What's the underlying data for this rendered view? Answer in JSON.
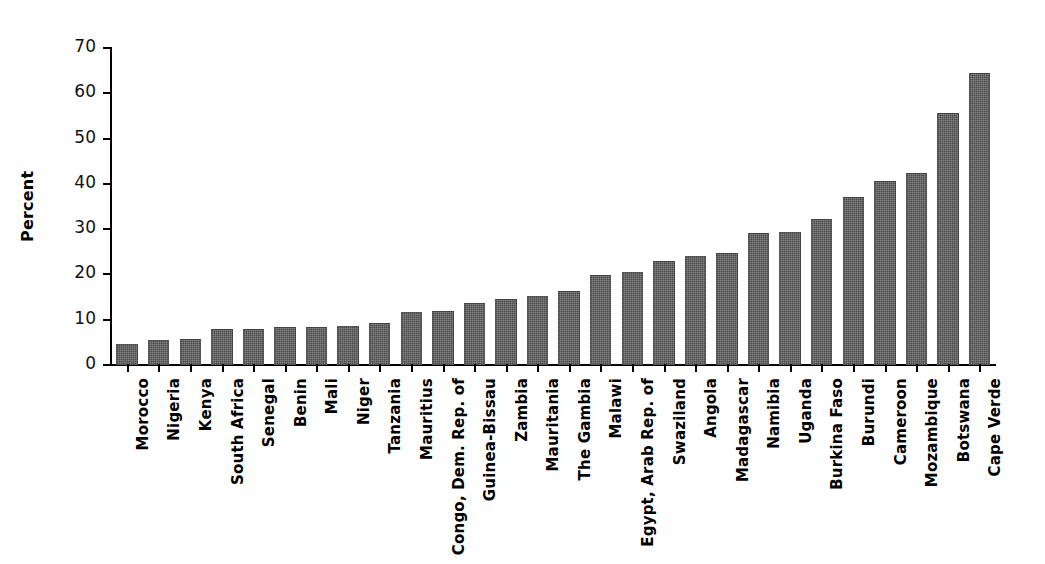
{
  "chart_data": {
    "type": "bar",
    "title": "",
    "xlabel": "",
    "ylabel": "Percent",
    "ylim": [
      0,
      70
    ],
    "yticks": [
      0,
      10,
      20,
      30,
      40,
      50,
      60,
      70
    ],
    "ytick_labels": [
      "0",
      "10",
      "20",
      "30",
      "40",
      "50",
      "60",
      "70"
    ],
    "grid": false,
    "legend": null,
    "bar_color": "#4b4b4b",
    "categories": [
      "Morocco",
      "Nigeria",
      "Kenya",
      "South Africa",
      "Senegal",
      "Benin",
      "Mali",
      "Niger",
      "Tanzania",
      "Mauritius",
      "Congo, Dem. Rep. of",
      "Guinea-Bissau",
      "Zambia",
      "Mauritania",
      "The Gambia",
      "Malawi",
      "Egypt, Arab Rep. of",
      "Swaziland",
      "Angola",
      "Madagascar",
      "Namibia",
      "Uganda",
      "Burkina Faso",
      "Burundi",
      "Cameroon",
      "Mozambique",
      "Botswana",
      "Cape Verde"
    ],
    "values": [
      4.7,
      5.5,
      5.8,
      8.0,
      7.9,
      8.3,
      8.4,
      8.6,
      9.3,
      11.6,
      12.0,
      13.8,
      14.5,
      15.2,
      16.4,
      19.8,
      20.6,
      23.0,
      24.1,
      24.8,
      29.2,
      29.3,
      32.2,
      37.0,
      40.6,
      42.4,
      55.7,
      64.5
    ]
  }
}
